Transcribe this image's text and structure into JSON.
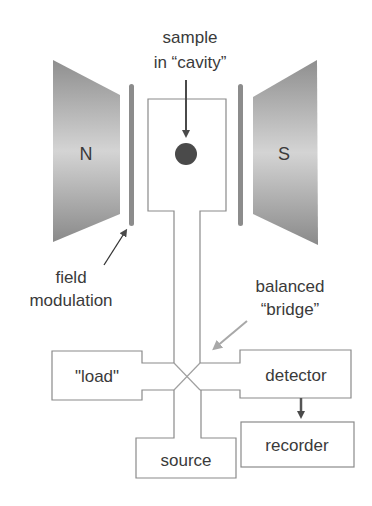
{
  "diagram": {
    "magnets": {
      "north": "N",
      "south": "S"
    },
    "labels": {
      "sample_line1": "sample",
      "sample_line2": "in “cavity”",
      "field_line1": "field",
      "field_line2": "modulation",
      "bridge_line1": "balanced",
      "bridge_line2": "“bridge”"
    },
    "boxes": {
      "load": "\"load\"",
      "detector": "detector",
      "source": "source",
      "recorder": "recorder"
    },
    "colors": {
      "magnet_dark": "#8a8a8a",
      "magnet_light": "#d6d6d6",
      "modulation_bar": "#8c8c8c",
      "sample": "#4a4a4a",
      "outline": "#8a8a8a",
      "bridge_arrow": "#a8a8a8",
      "text": "#3a3a3a"
    }
  }
}
